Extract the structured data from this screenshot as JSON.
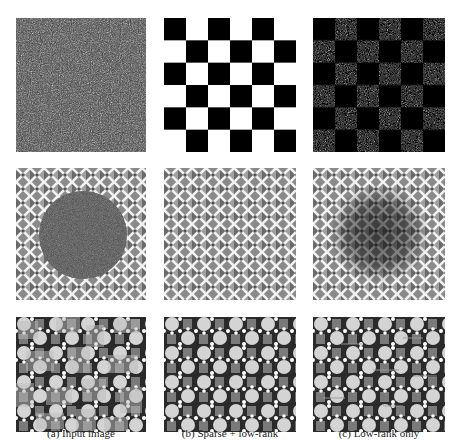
{
  "figure": {
    "columns": [
      {
        "id": "a",
        "caption": "(a) Input image"
      },
      {
        "id": "b",
        "caption": "(b) Sparse + low-rank"
      },
      {
        "id": "c",
        "caption": "(c) Low-rank only"
      }
    ],
    "rows": [
      {
        "id": "checkerboard",
        "description": "checkerboard texture"
      },
      {
        "id": "lattice",
        "description": "diagonal lattice texture with circular occlusion"
      },
      {
        "id": "tiles",
        "description": "circle-and-dot tile pattern with patch corruption"
      }
    ],
    "panels": [
      {
        "row": 0,
        "col": 0,
        "content": "noisy checkerboard (heavy salt-and-pepper noise)"
      },
      {
        "row": 0,
        "col": 1,
        "content": "clean 6x6 black/white checkerboard"
      },
      {
        "row": 0,
        "col": 2,
        "content": "checkerboard with residual noise in white cells"
      },
      {
        "row": 1,
        "col": 0,
        "content": "lattice with large noisy dark disc in center"
      },
      {
        "row": 1,
        "col": 1,
        "content": "clean recovered lattice"
      },
      {
        "row": 1,
        "col": 2,
        "content": "lattice with dark blurred blob in center"
      },
      {
        "row": 2,
        "col": 0,
        "content": "tile pattern with random corrupted patches"
      },
      {
        "row": 2,
        "col": 1,
        "content": "clean recovered tile pattern"
      },
      {
        "row": 2,
        "col": 2,
        "content": "tile pattern with faint streak artifacts"
      }
    ]
  }
}
